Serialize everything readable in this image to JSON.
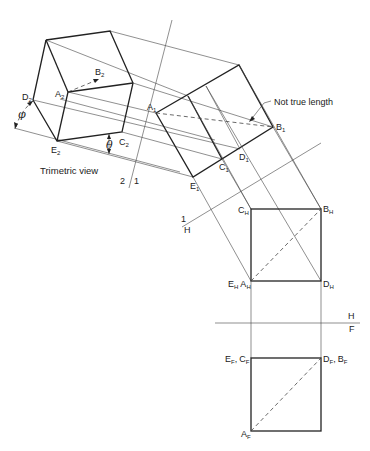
{
  "diagram": {
    "caption": "Trimetric view",
    "annotation": "Not true length",
    "angles": {
      "phi": "φ",
      "theta": "θ"
    },
    "fold_lines": {
      "f21": {
        "left": "2",
        "right": "1"
      },
      "f1h": {
        "top": "1",
        "bottom": "H"
      },
      "fhf": {
        "top": "H",
        "bottom": "F"
      }
    },
    "views": {
      "trimetric": {
        "A": {
          "base": "A",
          "sub": "2"
        },
        "B": {
          "base": "B",
          "sub": "2"
        },
        "C": {
          "base": "C",
          "sub": "2"
        },
        "D": {
          "base": "D",
          "sub": "2"
        },
        "E": {
          "base": "E",
          "sub": "2"
        }
      },
      "aux1": {
        "A": {
          "base": "A",
          "sub": "1"
        },
        "B": {
          "base": "B",
          "sub": "1"
        },
        "C": {
          "base": "C",
          "sub": "1"
        },
        "D": {
          "base": "D",
          "sub": "1"
        },
        "E": {
          "base": "E",
          "sub": "1"
        }
      },
      "top": {
        "C": {
          "base": "C",
          "sub": "H"
        },
        "B": {
          "base": "B",
          "sub": "H"
        },
        "E": {
          "base": "E",
          "sub": "H"
        },
        "A": {
          "base": "A",
          "sub": "H"
        },
        "D": {
          "base": "D",
          "sub": "H"
        }
      },
      "front": {
        "E": {
          "base": "E",
          "sub": "F"
        },
        "C": {
          "base": "C",
          "sub": "F"
        },
        "D": {
          "base": "D",
          "sub": "F"
        },
        "B": {
          "base": "B",
          "sub": "F"
        },
        "A": {
          "base": "A",
          "sub": "F"
        },
        "sep": ","
      }
    }
  }
}
